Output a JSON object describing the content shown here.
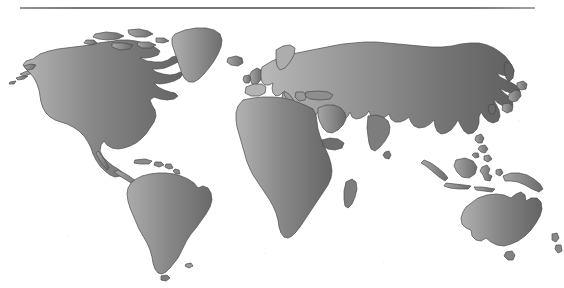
{
  "figure": {
    "kind": "world-map",
    "title": "",
    "caption": "",
    "projection": "miller-cylindrical",
    "background_color": "#ffffff",
    "has_top_rule": true,
    "has_border": false,
    "land_fill_style": "linear-gradient-west-light-to-east-dark",
    "land_color_light": "#b0b0b0",
    "land_color_mid": "#7c7c7c",
    "land_color_dark": "#636363",
    "ocean_color": "#ffffff",
    "outline_color": "#4a4a4a"
  },
  "landmasses": [
    {
      "id": "north-america",
      "label": "North America"
    },
    {
      "id": "south-america",
      "label": "South America"
    },
    {
      "id": "greenland",
      "label": "Greenland"
    },
    {
      "id": "iceland",
      "label": "Iceland"
    },
    {
      "id": "british-isles",
      "label": "British Isles"
    },
    {
      "id": "eurasia",
      "label": "Eurasia"
    },
    {
      "id": "africa",
      "label": "Africa"
    },
    {
      "id": "madagascar",
      "label": "Madagascar"
    },
    {
      "id": "japan",
      "label": "Japan"
    },
    {
      "id": "philippines",
      "label": "Philippines"
    },
    {
      "id": "indonesia",
      "label": "Indonesia"
    },
    {
      "id": "new-guinea",
      "label": "New Guinea"
    },
    {
      "id": "australia",
      "label": "Australia"
    },
    {
      "id": "tasmania",
      "label": "Tasmania"
    },
    {
      "id": "new-zealand",
      "label": "New Zealand"
    },
    {
      "id": "sri-lanka",
      "label": "Sri Lanka"
    },
    {
      "id": "caribbean-islands",
      "label": "Caribbean Islands"
    },
    {
      "id": "aleutian-islands",
      "label": "Aleutian Islands"
    },
    {
      "id": "canadian-arctic",
      "label": "Canadian Arctic Archipelago"
    }
  ]
}
